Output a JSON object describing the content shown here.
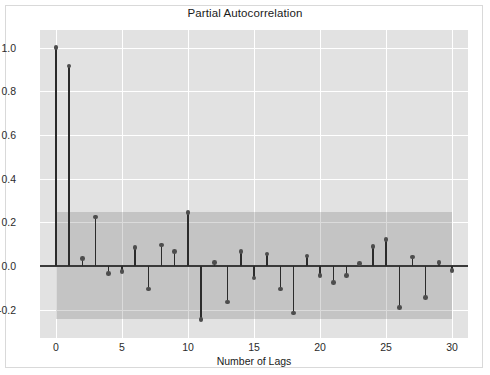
{
  "figure": {
    "background": "#ffffff",
    "panel_background": "#e2e2e2",
    "grid_color": "#ffffff",
    "stem_color": "#2b2b2b",
    "marker_color": "#4d4d4d",
    "ci_band_color": "rgba(90,90,90,0.22)",
    "zero_line_color": "#3a3a3a"
  },
  "chart_data": {
    "type": "bar",
    "title": "Partial Autocorrelation",
    "xlabel": "Number of Lags",
    "ylabel": "",
    "xlim": [
      -1.2,
      31.2
    ],
    "ylim": [
      -0.33,
      1.08
    ],
    "xticks": [
      0,
      5,
      10,
      15,
      20,
      25,
      30
    ],
    "xtick_labels": [
      "0",
      "5",
      "10",
      "15",
      "20",
      "25",
      "30"
    ],
    "yticks": [
      -0.2,
      0.0,
      0.2,
      0.4,
      0.6,
      0.8,
      1.0
    ],
    "ytick_labels": [
      "-0.2",
      "0.0",
      "0.2",
      "0.4",
      "0.6",
      "0.8",
      "1.0"
    ],
    "grid": true,
    "legend": null,
    "confidence_interval": {
      "upper": 0.245,
      "lower": -0.245,
      "from_lag": 0,
      "to_lag": 30
    },
    "categories": [
      0,
      1,
      2,
      3,
      4,
      5,
      6,
      7,
      8,
      9,
      10,
      11,
      12,
      13,
      14,
      15,
      16,
      17,
      18,
      19,
      20,
      21,
      22,
      23,
      24,
      25,
      26,
      27,
      28,
      29,
      30
    ],
    "values": [
      1.0,
      0.915,
      0.035,
      0.225,
      -0.035,
      -0.025,
      0.085,
      -0.105,
      0.095,
      0.065,
      0.245,
      -0.245,
      0.015,
      -0.165,
      0.065,
      -0.055,
      0.055,
      -0.105,
      -0.215,
      0.045,
      -0.045,
      -0.075,
      -0.045,
      0.01,
      0.09,
      0.12,
      -0.19,
      0.04,
      -0.145,
      0.015,
      -0.02
    ]
  }
}
